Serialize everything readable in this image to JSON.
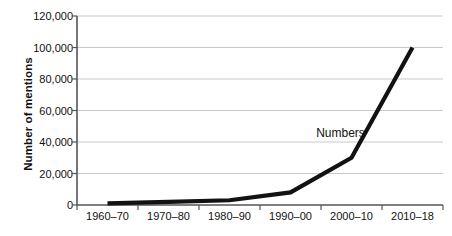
{
  "chart_data": {
    "type": "line",
    "title": "",
    "xlabel": "",
    "ylabel": "Number of mentions",
    "categories": [
      "1960–70",
      "1970–80",
      "1980–90",
      "1990–00",
      "2000–10",
      "2010–18"
    ],
    "series": [
      {
        "name": "Numbers",
        "values": [
          1000,
          2000,
          3000,
          8000,
          30000,
          100000
        ]
      }
    ],
    "ylim": [
      0,
      120000
    ],
    "yticks": [
      0,
      20000,
      40000,
      60000,
      80000,
      100000,
      120000
    ],
    "ytick_labels": [
      "0",
      "20,000",
      "40,000",
      "60,000",
      "80,000",
      "100,000",
      "120,000"
    ],
    "grid": true,
    "legend": "none",
    "annotations": [
      {
        "text": "Numbers",
        "x_frac": 0.72,
        "y_value": 46000
      }
    ],
    "colors": {
      "line": "#121212",
      "grid": "#c9c9c9",
      "axis": "#555555",
      "text": "#111111",
      "background": "#ffffff"
    }
  }
}
